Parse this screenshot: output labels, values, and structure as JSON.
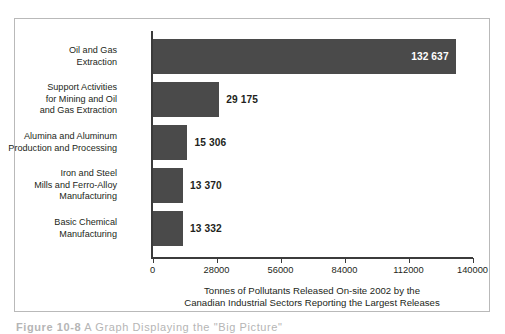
{
  "figure": {
    "caption_number": "Figure 10-8",
    "caption_text": "A Graph Displaying the \"Big Picture\""
  },
  "chart_data": {
    "type": "bar",
    "orientation": "horizontal",
    "title": "",
    "xlabel_line1": "Tonnes of Pollutants Released On-site 2002 by the",
    "xlabel_line2": "Canadian Industrial Sectors Reporting the Largest Releases",
    "ylabel": "",
    "xlim": [
      0,
      140000
    ],
    "xticks": [
      0,
      28000,
      56000,
      84000,
      112000,
      140000
    ],
    "xticklabels": [
      "0",
      "28000",
      "56000",
      "84000",
      "112000",
      "140000"
    ],
    "grid": false,
    "legend": false,
    "bar_color": "#4a4a4a",
    "categories": [
      "Oil and Gas\nExtraction",
      "Support Activities\nfor Mining and Oil\nand Gas Extraction",
      "Alumina and Aluminum\nProduction and Processing",
      "Iron and Steel\nMills and Ferro-Alloy\nManufacturing",
      "Basic Chemical\nManufacturing"
    ],
    "values": [
      132637,
      29175,
      15306,
      13370,
      13332
    ],
    "value_labels": [
      "132 637",
      "29 175",
      "15 306",
      "13 370",
      "13 332"
    ],
    "label_placement": [
      "inside",
      "outside",
      "outside",
      "outside",
      "outside"
    ]
  }
}
